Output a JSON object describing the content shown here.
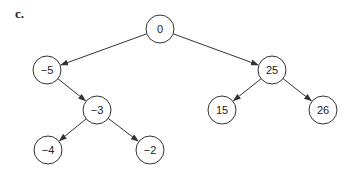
{
  "figure": {
    "label": "c."
  },
  "tree": {
    "nodes": [
      {
        "id": "n0",
        "value": "0",
        "x": 160,
        "y": 29
      },
      {
        "id": "n1",
        "value": "−5",
        "x": 47,
        "y": 70
      },
      {
        "id": "n2",
        "value": "25",
        "x": 272,
        "y": 70
      },
      {
        "id": "n3",
        "value": "−3",
        "x": 97,
        "y": 110
      },
      {
        "id": "n4",
        "value": "15",
        "x": 222,
        "y": 110
      },
      {
        "id": "n5",
        "value": "26",
        "x": 323,
        "y": 110
      },
      {
        "id": "n6",
        "value": "−4",
        "x": 48,
        "y": 150
      },
      {
        "id": "n7",
        "value": "−2",
        "x": 150,
        "y": 150
      }
    ],
    "edges": [
      {
        "from": "n0",
        "to": "n1"
      },
      {
        "from": "n0",
        "to": "n2"
      },
      {
        "from": "n1",
        "to": "n3"
      },
      {
        "from": "n2",
        "to": "n4"
      },
      {
        "from": "n2",
        "to": "n5"
      },
      {
        "from": "n3",
        "to": "n6"
      },
      {
        "from": "n3",
        "to": "n7"
      }
    ],
    "node_radius": 14,
    "colors": {
      "stroke": "#333333",
      "fill": "#ffffff",
      "text": "#222222"
    }
  }
}
